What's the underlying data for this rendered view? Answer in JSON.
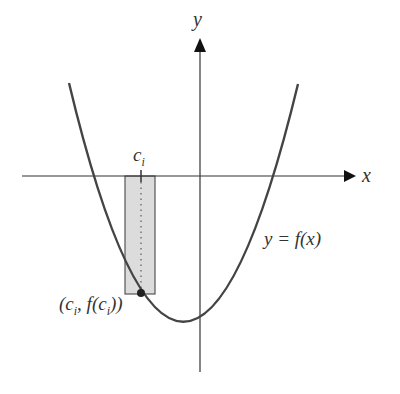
{
  "diagram": {
    "axes": {
      "x_label": "x",
      "y_label": "y"
    },
    "curve_label": "y = f(x)",
    "tick_label": "c",
    "tick_sub": "i",
    "point_label_open": "(c",
    "point_label_sub1": "i",
    "point_label_mid": ", f(c",
    "point_label_sub2": "i",
    "point_label_close": "))",
    "colors": {
      "curve": "#444444",
      "axis": "#333333",
      "rect_fill": "#dcdcdc",
      "rect_stroke": "#555555"
    }
  }
}
